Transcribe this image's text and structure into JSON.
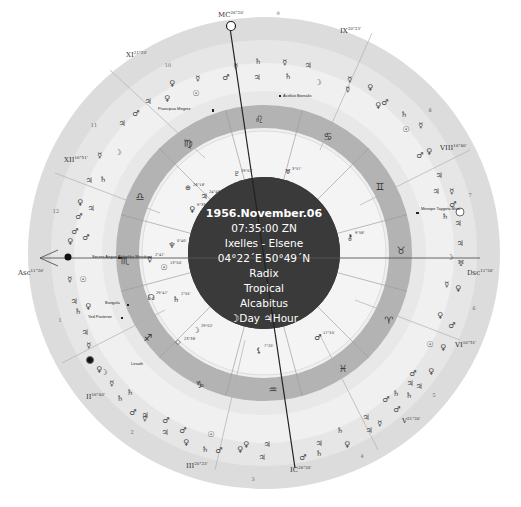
{
  "chart_info": {
    "date": "1956.November.06",
    "time": "07:35:00 ZN",
    "place": "Ixelles - Elsene",
    "coordinates": "04°22´E 50°49´N",
    "chart_type": "Radix",
    "zodiac": "Tropical",
    "house_system": "Alcabitus",
    "day_hour": "☽Day ♃Hour"
  },
  "angles": {
    "asc": {
      "label": "Asc",
      "degree": "11°26'"
    },
    "dsc": {
      "label": "Dsc",
      "degree": "11°26'"
    },
    "mc": {
      "label": "MC",
      "degree": "26°20'"
    },
    "ic": {
      "label": "IC",
      "degree": "26°20'"
    }
  },
  "house_cusps": [
    {
      "label": "XI",
      "degree": "21°20'"
    },
    {
      "label": "IX",
      "degree": "20°23'"
    },
    {
      "label": "XII",
      "degree": "16°51'"
    },
    {
      "label": "VIII",
      "degree": "16°40'"
    },
    {
      "label": "II",
      "degree": "16°40'"
    },
    {
      "label": "VI",
      "degree": "16°51'"
    },
    {
      "label": "III",
      "degree": "20°23'"
    },
    {
      "label": "V",
      "degree": "21°20'"
    }
  ],
  "house_numbers": [
    "1",
    "2",
    "3",
    "4",
    "5",
    "6",
    "7",
    "8",
    "9",
    "10",
    "11",
    "12"
  ],
  "signs": [
    {
      "name": "Leo",
      "glyph": "♌"
    },
    {
      "name": "Cancer",
      "glyph": "♋"
    },
    {
      "name": "Gemini",
      "glyph": "♊"
    },
    {
      "name": "Taurus",
      "glyph": "♉"
    },
    {
      "name": "Aries",
      "glyph": "♈"
    },
    {
      "name": "Pisces",
      "glyph": "♓"
    },
    {
      "name": "Aquarius",
      "glyph": "♒"
    },
    {
      "name": "Capricorn",
      "glyph": "♑"
    },
    {
      "name": "Sagittarius",
      "glyph": "♐"
    },
    {
      "name": "Scorpio",
      "glyph": "♏"
    },
    {
      "name": "Libra",
      "glyph": "♎"
    },
    {
      "name": "Virgo",
      "glyph": "♍"
    }
  ],
  "planets": [
    {
      "name": "Uranus",
      "glyph": "♅",
      "degree": "3°57'"
    },
    {
      "name": "Pars Fortunae",
      "glyph": "⊕",
      "degree": "26°18'"
    },
    {
      "name": "Jupiter",
      "glyph": "♃",
      "degree": "24°48'"
    },
    {
      "name": "Venus",
      "glyph": "♀",
      "degree": "9°33'"
    },
    {
      "name": "Neptune",
      "glyph": "♆",
      "degree": "0°40'"
    },
    {
      "name": "Mercury",
      "glyph": "☿",
      "degree": "2°47'"
    },
    {
      "name": "Sun",
      "glyph": "☉",
      "degree": "13°50'"
    },
    {
      "name": "North Node",
      "glyph": "☊",
      "degree": "29°47'"
    },
    {
      "name": "Saturn",
      "glyph": "♄",
      "degree": "2°55'"
    },
    {
      "name": "Moon",
      "glyph": "☽",
      "degree": "29°02'"
    },
    {
      "name": "Vertex",
      "glyph": "◇",
      "degree": "23°38'"
    },
    {
      "name": "Lilith",
      "glyph": "⚸",
      "degree": "7°20'"
    },
    {
      "name": "Mars",
      "glyph": "♂",
      "degree": "17°55'"
    },
    {
      "name": "Pluto",
      "glyph": "♇",
      "degree": "29°02'"
    },
    {
      "name": "Chiron",
      "glyph": "⚷",
      "degree": "9°58'"
    }
  ],
  "fixed_stars": [
    "Praecipua Megrez",
    "Acelius Borealis",
    "Menope Taygeta Maia",
    "Secrex Aegae Alphekka Meridiani",
    "Bungula",
    "Yed Posterior",
    "Lesath"
  ],
  "colors": {
    "outer_ring": "#d9d9d9",
    "outer_ring_alt": "#e4e4e4",
    "sign_ring": "#a8a8a8",
    "sign_ring_alt": "#bcbcbc",
    "tick_ring": "#e0e0e0",
    "inner_area": "#ececec",
    "center_disc": "#3a3a3a",
    "axis_line": "#333333"
  }
}
